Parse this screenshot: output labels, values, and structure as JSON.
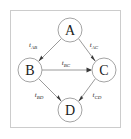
{
  "figure": {
    "type": "directed-graph",
    "frame": {
      "border_color": "#cccccc",
      "background_color": "#ffffff"
    }
  },
  "nodes": [
    {
      "id": "A",
      "label": "A",
      "cx": 70,
      "cy": 30,
      "r": 12
    },
    {
      "id": "B",
      "label": "B",
      "cx": 30,
      "cy": 70,
      "r": 12
    },
    {
      "id": "C",
      "label": "C",
      "cx": 104,
      "cy": 70,
      "r": 12
    },
    {
      "id": "D",
      "label": "D",
      "cx": 70,
      "cy": 110,
      "r": 12
    }
  ],
  "edges": [
    {
      "id": "AB",
      "from": "A",
      "to": "B",
      "label_base": "t",
      "label_sub": "AB",
      "label_x": 33,
      "label_y": 45
    },
    {
      "id": "AC",
      "from": "A",
      "to": "C",
      "label_base": "t",
      "label_sub": "AC",
      "label_x": 94,
      "label_y": 45
    },
    {
      "id": "BC",
      "from": "B",
      "to": "C",
      "label_base": "t",
      "label_sub": "BC",
      "label_x": 66,
      "label_y": 63
    },
    {
      "id": "BD",
      "from": "B",
      "to": "D",
      "label_base": "t",
      "label_sub": "BD",
      "label_x": 39,
      "label_y": 95
    },
    {
      "id": "CD",
      "from": "C",
      "to": "D",
      "label_base": "t",
      "label_sub": "CD",
      "label_x": 97,
      "label_y": 95
    }
  ],
  "colors": {
    "node_stroke": "#9a9a9a",
    "node_fill": "#ffffff",
    "node_text": "#1a1a1a",
    "edge_stroke": "#8f8f8f",
    "arrow_fill": "#3a3a3a",
    "label_text": "#2b2b2b",
    "frame_border": "#cccccc"
  }
}
